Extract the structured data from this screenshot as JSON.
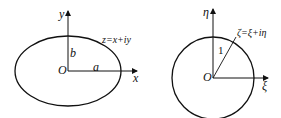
{
  "left_diagram": {
    "title": "z-plane ellipse",
    "axis_y_label": "y",
    "axis_x_label": "x",
    "origin_label": "O",
    "semi_major_label": "a",
    "semi_minor_label": "b",
    "plane_label": "z=x+iy"
  },
  "right_diagram": {
    "title": "ζ-plane unit circle",
    "axis_vertical_label": "η",
    "axis_horizontal_label": "ξ",
    "origin_label": "O",
    "radius_label": "1",
    "plane_label": "ζ=ξ+iη"
  },
  "colors": {
    "stroke": "#111111",
    "background": "#ffffff"
  }
}
